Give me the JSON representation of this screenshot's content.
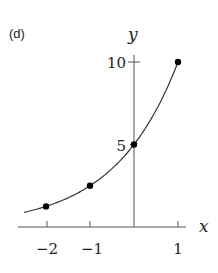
{
  "panel_label": "(d)",
  "chart_data": {
    "type": "line",
    "title": "",
    "function": "y = 5 * 2^x",
    "xlabel": "x",
    "ylabel": "y",
    "xlim": [
      -2.6,
      1.2
    ],
    "ylim": [
      0,
      10.5
    ],
    "x_ticks": [
      -2,
      -1,
      0,
      1
    ],
    "x_tick_labels": [
      "−2",
      "−1",
      "",
      "1"
    ],
    "y_ticks": [
      5,
      10
    ],
    "y_tick_labels": [
      "5",
      "10"
    ],
    "grid": false,
    "legend": null,
    "series": [
      {
        "name": "curve",
        "x": [
          -2.5,
          -2,
          -1.5,
          -1,
          -0.5,
          0,
          0.5,
          1
        ],
        "values": [
          0.88,
          1.25,
          1.77,
          2.5,
          3.54,
          5,
          7.07,
          10
        ]
      }
    ],
    "marked_points": [
      {
        "x": -2,
        "y": 1.25
      },
      {
        "x": -1,
        "y": 2.5
      },
      {
        "x": 0,
        "y": 5
      },
      {
        "x": 1,
        "y": 10
      }
    ]
  },
  "labels": {
    "x_axis": "x",
    "y_axis": "y",
    "xtick_m2": "−2",
    "xtick_m1": "−1",
    "xtick_1": "1",
    "ytick_5": "5",
    "ytick_10": "10"
  }
}
